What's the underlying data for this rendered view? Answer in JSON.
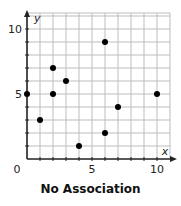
{
  "chart_data": {
    "type": "scatter",
    "title": "No Association",
    "xlabel": "x",
    "ylabel": "y",
    "xlim": [
      0,
      11
    ],
    "ylim": [
      0,
      11
    ],
    "grid": true,
    "x_ticks": [
      0,
      5,
      10
    ],
    "y_ticks": [
      5,
      10
    ],
    "origin_label": "0",
    "points": [
      {
        "x": 0,
        "y": 5
      },
      {
        "x": 1,
        "y": 3
      },
      {
        "x": 2,
        "y": 7
      },
      {
        "x": 2,
        "y": 5
      },
      {
        "x": 3,
        "y": 6
      },
      {
        "x": 4,
        "y": 1
      },
      {
        "x": 6,
        "y": 9
      },
      {
        "x": 6,
        "y": 2
      },
      {
        "x": 7,
        "y": 4
      },
      {
        "x": 10,
        "y": 5
      }
    ]
  },
  "colors": {
    "grid": "#bdbdbd",
    "axis": "#222222",
    "point": "#000000"
  }
}
